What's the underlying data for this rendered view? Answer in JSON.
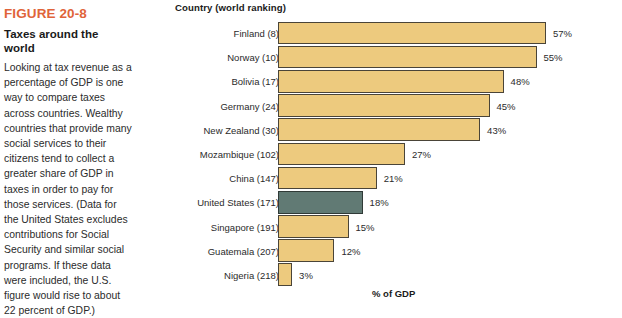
{
  "figure": {
    "number": "FIGURE 20-8",
    "title": "Taxes around the world",
    "caption": "Looking at tax revenue as a percentage of GDP is one way to compare taxes across countries. Wealthy countries that provide many social services to their citizens tend to collect a greater share of GDP in taxes in order to pay for those services. (Data for the United States excludes contributions for Social Security and similar social programs. If these data were included, the U.S. figure would rise to about 22 percent of GDP.)",
    "number_color": "#e0643a"
  },
  "chart_data": {
    "type": "bar",
    "orientation": "horizontal",
    "title": "Taxes around the world",
    "xlabel": "% of GDP",
    "ylabel": "Country (world ranking)",
    "xlim": [
      0,
      60
    ],
    "grid": false,
    "legend": false,
    "bar_color": "#edca7e",
    "highlight_color": "#617a74",
    "highlight_category": "United States  (171)",
    "categories": [
      "Finland  (8)",
      "Norway  (10)",
      "Bolivia (17)",
      "Germany (24)",
      "New Zealand (30)",
      "Mozambique (102)",
      "China (147)",
      "United States  (171)",
      "Singapore (191)",
      "Guatemala (207)",
      "Nigeria (218)"
    ],
    "values": [
      57,
      55,
      48,
      45,
      43,
      27,
      21,
      18,
      15,
      12,
      3
    ],
    "value_labels": [
      "57%",
      "55%",
      "48%",
      "45%",
      "43%",
      "27%",
      "21%",
      "18%",
      "15%",
      "12%",
      "3%"
    ],
    "countries": [
      {
        "name": "Finland",
        "ranking": 8,
        "value": 57,
        "label": "Finland  (8)",
        "value_label": "57%",
        "highlight": false
      },
      {
        "name": "Norway",
        "ranking": 10,
        "value": 55,
        "label": "Norway  (10)",
        "value_label": "55%",
        "highlight": false
      },
      {
        "name": "Bolivia",
        "ranking": 17,
        "value": 48,
        "label": "Bolivia (17)",
        "value_label": "48%",
        "highlight": false
      },
      {
        "name": "Germany",
        "ranking": 24,
        "value": 45,
        "label": "Germany (24)",
        "value_label": "45%",
        "highlight": false
      },
      {
        "name": "New Zealand",
        "ranking": 30,
        "value": 43,
        "label": "New Zealand (30)",
        "value_label": "43%",
        "highlight": false
      },
      {
        "name": "Mozambique",
        "ranking": 102,
        "value": 27,
        "label": "Mozambique (102)",
        "value_label": "27%",
        "highlight": false
      },
      {
        "name": "China",
        "ranking": 147,
        "value": 21,
        "label": "China (147)",
        "value_label": "21%",
        "highlight": false
      },
      {
        "name": "United States",
        "ranking": 171,
        "value": 18,
        "label": "United States  (171)",
        "value_label": "18%",
        "highlight": true
      },
      {
        "name": "Singapore",
        "ranking": 191,
        "value": 15,
        "label": "Singapore (191)",
        "value_label": "15%",
        "highlight": false
      },
      {
        "name": "Guatemala",
        "ranking": 207,
        "value": 12,
        "label": "Guatemala (207)",
        "value_label": "12%",
        "highlight": false
      },
      {
        "name": "Nigeria",
        "ranking": 218,
        "value": 3,
        "label": "Nigeria (218)",
        "value_label": "3%",
        "highlight": false
      }
    ]
  }
}
